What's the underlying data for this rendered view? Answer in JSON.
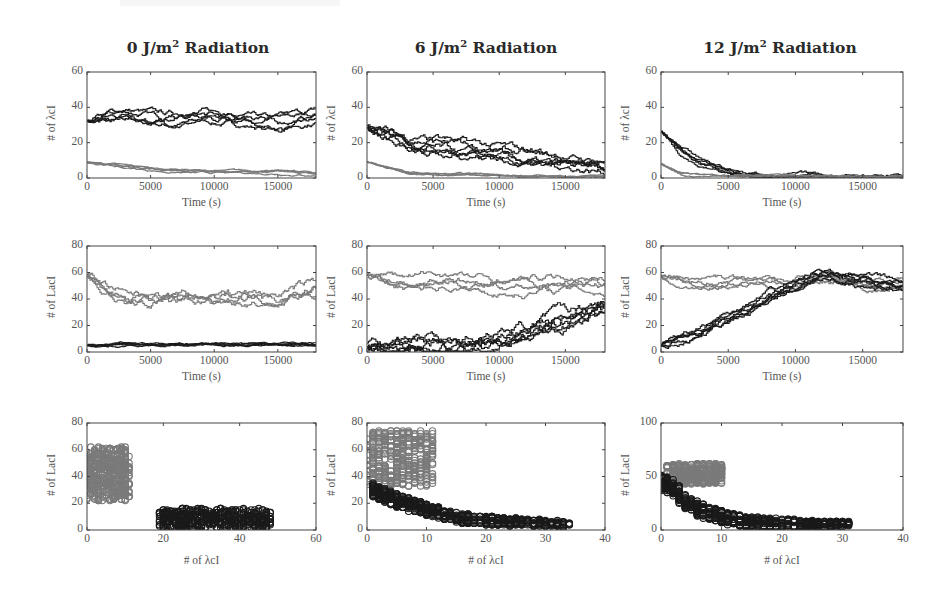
{
  "figure": {
    "column_titles": [
      {
        "dose": "0 J/m",
        "sup": "2",
        "suffix": " Radiation"
      },
      {
        "dose": "6 J/m",
        "sup": "2",
        "suffix": " Radiation"
      },
      {
        "dose": "12 J/m",
        "sup": "2",
        "suffix": " Radiation"
      }
    ],
    "colors": {
      "dark_series": "#1a1a1a",
      "gray_series": "#7a7a7a",
      "axis": "#444444",
      "tick_text": "#555555"
    }
  },
  "chart_data": [
    {
      "id": "r1c1",
      "type": "line",
      "title": "0 J/m2 Radiation",
      "xlabel": "Time (s)",
      "ylabel": "# of λcI",
      "xlim": [
        0,
        18000
      ],
      "ylim": [
        0,
        60
      ],
      "xticks": [
        0,
        5000,
        10000,
        15000
      ],
      "yticks": [
        0,
        20,
        40,
        60
      ],
      "grid": false,
      "series": [
        {
          "name": "λcI (dark) trajectories",
          "color": "dark",
          "count": 5,
          "start": 32,
          "end": 35,
          "x": [
            0,
            3000,
            6000,
            9000,
            12000,
            15000,
            18000
          ],
          "values": [
            32,
            36,
            33,
            35,
            33,
            31,
            35
          ],
          "spread": 6
        },
        {
          "name": "λcI (gray) trajectories",
          "color": "gray",
          "count": 4,
          "start": 9,
          "end": 2,
          "x": [
            0,
            3000,
            6000,
            9000,
            12000,
            15000,
            18000
          ],
          "values": [
            9,
            6,
            4,
            3,
            3,
            3,
            2
          ],
          "spread": 2
        }
      ]
    },
    {
      "id": "r1c2",
      "type": "line",
      "title": "6 J/m2 Radiation",
      "xlabel": "Time (s)",
      "ylabel": "# of λcI",
      "xlim": [
        0,
        18000
      ],
      "ylim": [
        0,
        60
      ],
      "xticks": [
        0,
        5000,
        10000,
        15000
      ],
      "yticks": [
        0,
        20,
        40,
        60
      ],
      "grid": false,
      "series": [
        {
          "name": "λcI (dark) trajectories",
          "color": "dark",
          "count": 6,
          "x": [
            0,
            3000,
            6000,
            9000,
            12000,
            15000,
            18000
          ],
          "values": [
            29,
            20,
            18,
            15,
            12,
            9,
            6
          ],
          "spread": 8
        },
        {
          "name": "λcI (gray) trajectories",
          "color": "gray",
          "count": 4,
          "x": [
            0,
            3000,
            6000,
            9000,
            12000,
            15000,
            18000
          ],
          "values": [
            9,
            3,
            2,
            2,
            1,
            1,
            1
          ],
          "spread": 1.5
        }
      ]
    },
    {
      "id": "r1c3",
      "type": "line",
      "title": "12 J/m2 Radiation",
      "xlabel": "Time (s)",
      "ylabel": "# of λcI",
      "xlim": [
        0,
        18000
      ],
      "ylim": [
        0,
        60
      ],
      "xticks": [
        0,
        5000,
        10000,
        15000
      ],
      "yticks": [
        0,
        20,
        40,
        60
      ],
      "grid": false,
      "series": [
        {
          "name": "λcI (dark) trajectories",
          "color": "dark",
          "count": 5,
          "x": [
            0,
            1500,
            3000,
            4500,
            6000,
            9000,
            12000,
            15000,
            18000
          ],
          "values": [
            26,
            15,
            8,
            5,
            2,
            1,
            1,
            0.5,
            0.5
          ],
          "spread": 4
        },
        {
          "name": "λcI (gray) trajectories",
          "color": "gray",
          "count": 3,
          "x": [
            0,
            1500,
            3000,
            6000,
            12000,
            18000
          ],
          "values": [
            8,
            2,
            1,
            1,
            0.5,
            0.5
          ],
          "spread": 1.5
        }
      ]
    },
    {
      "id": "r2c1",
      "type": "line",
      "xlabel": "Time (s)",
      "ylabel": "# of LacI",
      "xlim": [
        0,
        18000
      ],
      "ylim": [
        0,
        80
      ],
      "xticks": [
        0,
        5000,
        10000,
        15000
      ],
      "yticks": [
        0,
        20,
        40,
        60,
        80
      ],
      "grid": false,
      "series": [
        {
          "name": "LacI (gray) trajectories",
          "color": "gray",
          "count": 4,
          "x": [
            0,
            3000,
            6000,
            9000,
            12000,
            15000,
            18000
          ],
          "values": [
            58,
            40,
            42,
            40,
            43,
            42,
            50
          ],
          "spread": 12
        },
        {
          "name": "LacI (dark) trajectories",
          "color": "dark",
          "count": 5,
          "x": [
            0,
            3000,
            6000,
            9000,
            12000,
            15000,
            18000
          ],
          "values": [
            5,
            6,
            6,
            6,
            6,
            6,
            6
          ],
          "spread": 3
        }
      ]
    },
    {
      "id": "r2c2",
      "type": "line",
      "xlabel": "Time (s)",
      "ylabel": "# of LacI",
      "xlim": [
        0,
        18000
      ],
      "ylim": [
        0,
        80
      ],
      "xticks": [
        0,
        5000,
        10000,
        15000
      ],
      "yticks": [
        0,
        20,
        40,
        60,
        80
      ],
      "grid": false,
      "series": [
        {
          "name": "LacI (gray) trajectories",
          "color": "gray",
          "count": 4,
          "x": [
            0,
            3000,
            6000,
            9000,
            12000,
            15000,
            18000
          ],
          "values": [
            58,
            52,
            55,
            50,
            50,
            52,
            50
          ],
          "spread": 10
        },
        {
          "name": "LacI (dark) trajectories",
          "color": "dark",
          "count": 6,
          "x": [
            0,
            3000,
            6000,
            9000,
            12000,
            15000,
            18000
          ],
          "values": [
            5,
            6,
            7,
            9,
            16,
            25,
            35
          ],
          "spread": 14
        }
      ]
    },
    {
      "id": "r2c3",
      "type": "line",
      "xlabel": "Time (s)",
      "ylabel": "# of LacI",
      "xlim": [
        0,
        18000
      ],
      "ylim": [
        0,
        80
      ],
      "xticks": [
        0,
        5000,
        10000,
        15000
      ],
      "yticks": [
        0,
        20,
        40,
        60,
        80
      ],
      "grid": false,
      "series": [
        {
          "name": "LacI (gray) trajectories",
          "color": "gray",
          "count": 4,
          "x": [
            0,
            3000,
            6000,
            9000,
            12000,
            15000,
            18000
          ],
          "values": [
            57,
            52,
            54,
            52,
            56,
            52,
            52
          ],
          "spread": 8
        },
        {
          "name": "LacI (dark) trajectories",
          "color": "dark",
          "count": 6,
          "x": [
            0,
            2000,
            4000,
            6000,
            8000,
            10000,
            12000,
            14000,
            16000,
            18000
          ],
          "values": [
            5,
            10,
            20,
            30,
            40,
            50,
            58,
            56,
            52,
            50
          ],
          "spread": 8
        }
      ]
    },
    {
      "id": "r3c1",
      "type": "scatter",
      "xlabel": "# of λcI",
      "ylabel": "# of LacI",
      "xlim": [
        0,
        60
      ],
      "ylim": [
        0,
        80
      ],
      "xticks": [
        0,
        20,
        40,
        60
      ],
      "yticks": [
        0,
        20,
        40,
        60,
        80
      ],
      "grid": false,
      "series": [
        {
          "name": "gray state cluster",
          "color": "gray",
          "x_range": [
            0,
            11
          ],
          "y_range": [
            22,
            62
          ],
          "center": [
            5,
            44
          ]
        },
        {
          "name": "dark state cluster",
          "color": "dark",
          "x_range": [
            19,
            48
          ],
          "y_range": [
            1,
            16
          ],
          "center": [
            32,
            6
          ]
        }
      ]
    },
    {
      "id": "r3c2",
      "type": "scatter",
      "xlabel": "# of λcI",
      "ylabel": "# of LacI",
      "xlim": [
        0,
        40
      ],
      "ylim": [
        0,
        80
      ],
      "xticks": [
        0,
        10,
        20,
        30,
        40
      ],
      "yticks": [
        0,
        20,
        40,
        60,
        80
      ],
      "grid": false,
      "series": [
        {
          "name": "gray state cluster",
          "color": "gray",
          "x_range": [
            0,
            11
          ],
          "y_range": [
            33,
            74
          ],
          "center": [
            3,
            52
          ]
        },
        {
          "name": "dark state trail",
          "color": "dark",
          "path_x": [
            1,
            5,
            10,
            15,
            20,
            25,
            30,
            34
          ],
          "path_y": [
            30,
            22,
            15,
            9,
            7,
            6,
            5,
            4
          ],
          "width_y": 10
        }
      ]
    },
    {
      "id": "r3c3",
      "type": "scatter",
      "xlabel": "# of λcI",
      "ylabel": "# of LacI",
      "xlim": [
        0,
        40
      ],
      "ylim": [
        0,
        100
      ],
      "xticks": [
        0,
        10,
        20,
        30,
        40
      ],
      "yticks": [
        0,
        50,
        100
      ],
      "grid": false,
      "series": [
        {
          "name": "gray state cluster",
          "color": "gray",
          "x_range": [
            1,
            10
          ],
          "y_range": [
            43,
            62
          ],
          "center": [
            5,
            55
          ]
        },
        {
          "name": "dark state trail",
          "color": "dark",
          "path_x": [
            0,
            2,
            4,
            7,
            10,
            14,
            20,
            26,
            31
          ],
          "path_y": [
            45,
            40,
            25,
            18,
            12,
            8,
            6,
            5,
            5
          ],
          "width_y": 14
        }
      ]
    }
  ]
}
